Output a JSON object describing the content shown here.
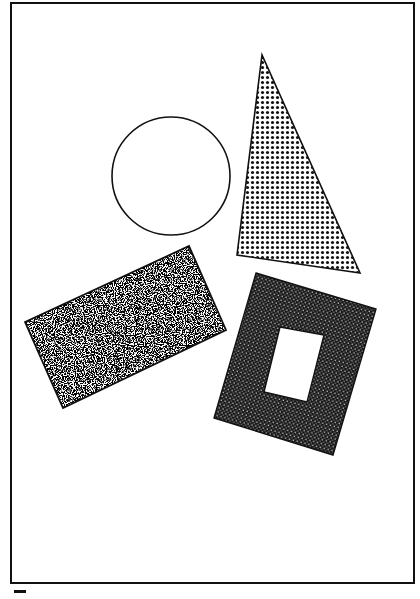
{
  "figure": {
    "frame": {
      "x": 11,
      "y": 3,
      "w": 403,
      "h": 580,
      "stroke": "#111111"
    },
    "shapes": [
      {
        "id": "circle",
        "type": "circle",
        "fill": "none",
        "cx": 171,
        "cy": 176,
        "r": 59
      },
      {
        "id": "triangle",
        "type": "polygon",
        "fill": "dots",
        "points": "262,55 237,255 360,273"
      },
      {
        "id": "rectangle",
        "type": "polygon",
        "fill": "speckle",
        "points": "25,322 189,246 226,330 63,408"
      },
      {
        "id": "frame-square",
        "type": "polygon-with-hole",
        "fill": "dense-checker",
        "outer": "256,273 376,309 333,455 214,418",
        "hole": "280,327 324,335 307,402 264,392"
      }
    ]
  }
}
